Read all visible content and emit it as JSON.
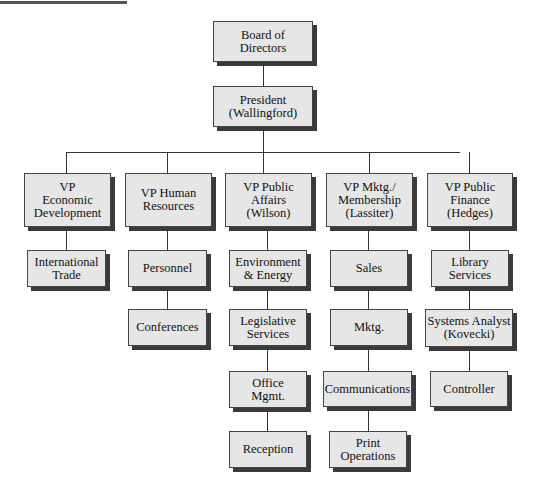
{
  "chart": {
    "title_bar": "decorative-top-rule",
    "nodes": {
      "board": "Board of\nDirectors",
      "president": "President\n(Wallingford)",
      "vp_econ": "VP\nEconomic\nDevelopment",
      "vp_hr": "VP Human\nResources",
      "vp_pa": "VP Public\nAffairs\n(Wilson)",
      "vp_mktg": "VP Mktg./\nMembership\n(Lassiter)",
      "vp_fin": "VP Public\nFinance\n(Hedges)",
      "intl_trade": "International\nTrade",
      "personnel": "Personnel",
      "conferences": "Conferences",
      "env_energy": "Environment\n& Energy",
      "legislative": "Legislative\nServices",
      "office_mgmt": "Office\nMgmt.",
      "reception": "Reception",
      "sales": "Sales",
      "mktg": "Mktg.",
      "communications": "Communications",
      "print_ops": "Print\nOperations",
      "library": "Library\nServices",
      "sys_analyst": "Systems Analyst\n(Kovecki)",
      "controller": "Controller"
    }
  },
  "colors": {
    "box_fill": "#e6e6e6",
    "box_border": "#444444",
    "shadow": "#3a3a3a",
    "line": "#333333"
  }
}
